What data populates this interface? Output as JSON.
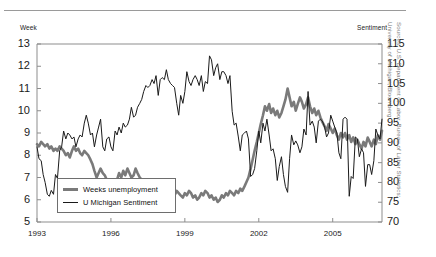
{
  "figure": {
    "left_axis_title": "Week",
    "right_axis_title": "Sentiment",
    "source_line_1": "Sources: U.S. Department of Labor, Bureau of Labor Statistics;",
    "source_line_2": "University of Michigan; Bloomberg",
    "series_color_unemployment": "#7a7a7a",
    "series_color_sentiment": "#1a1a1a",
    "frame_color": "#8d8d8d"
  },
  "legend": {
    "items": [
      {
        "label": "Weeks unemployment",
        "style": "thick-gray"
      },
      {
        "label": "U Michigan Sentiment",
        "style": "thin-black"
      }
    ]
  },
  "chart_data": {
    "type": "line",
    "title": "",
    "subtitle": "",
    "xlabel": "",
    "ylabel": "Week",
    "y2label": "Sentiment",
    "grid": false,
    "legend_position": "inside-bottom-left",
    "xlim": [
      1993.0,
      2007.0
    ],
    "xticks": [
      1993,
      1996,
      1999,
      2002,
      2005
    ],
    "xtick_labels": [
      "1993",
      "1996",
      "1999",
      "2002",
      "2005"
    ],
    "ylim": [
      5,
      13
    ],
    "yticks": [
      5,
      6,
      7,
      8,
      9,
      10,
      11,
      12,
      13
    ],
    "ytick_labels": [
      "5",
      "6",
      "7",
      "8",
      "9",
      "10",
      "11",
      "12",
      "13"
    ],
    "y2lim": [
      70,
      115
    ],
    "y2ticks": [
      70,
      75,
      80,
      85,
      90,
      95,
      100,
      105,
      110,
      115
    ],
    "y2tick_labels": [
      "70",
      "75",
      "80",
      "85",
      "90",
      "95",
      "100",
      "105",
      "110",
      "115"
    ],
    "series": [
      {
        "name": "Weeks unemployment",
        "axis": "left",
        "units": "weeks",
        "color": "#7a7a7a",
        "line_width": 2.6,
        "x": [
          1993.0,
          1993.08,
          1993.17,
          1993.25,
          1993.33,
          1993.42,
          1993.5,
          1993.58,
          1993.67,
          1993.75,
          1993.83,
          1993.92,
          1994.0,
          1994.08,
          1994.17,
          1994.25,
          1994.33,
          1994.42,
          1994.5,
          1994.58,
          1994.67,
          1994.75,
          1994.83,
          1994.92,
          1995.0,
          1995.08,
          1995.17,
          1995.25,
          1995.33,
          1995.42,
          1995.5,
          1995.58,
          1995.67,
          1995.75,
          1995.83,
          1995.92,
          1996.0,
          1996.08,
          1996.17,
          1996.25,
          1996.33,
          1996.42,
          1996.5,
          1996.58,
          1996.67,
          1996.75,
          1996.83,
          1996.92,
          1997.0,
          1997.08,
          1997.17,
          1997.25,
          1997.33,
          1997.42,
          1997.5,
          1997.58,
          1997.67,
          1997.75,
          1997.83,
          1997.92,
          1998.0,
          1998.08,
          1998.17,
          1998.25,
          1998.33,
          1998.42,
          1998.5,
          1998.58,
          1998.67,
          1998.75,
          1998.83,
          1998.92,
          1999.0,
          1999.08,
          1999.17,
          1999.25,
          1999.33,
          1999.42,
          1999.5,
          1999.58,
          1999.67,
          1999.75,
          1999.83,
          1999.92,
          2000.0,
          2000.08,
          2000.17,
          2000.25,
          2000.33,
          2000.42,
          2000.5,
          2000.58,
          2000.67,
          2000.75,
          2000.83,
          2000.92,
          2001.0,
          2001.08,
          2001.17,
          2001.25,
          2001.33,
          2001.42,
          2001.5,
          2001.58,
          2001.67,
          2001.75,
          2001.83,
          2001.92,
          2002.0,
          2002.08,
          2002.17,
          2002.25,
          2002.33,
          2002.42,
          2002.5,
          2002.58,
          2002.67,
          2002.75,
          2002.83,
          2002.92,
          2003.0,
          2003.08,
          2003.17,
          2003.25,
          2003.33,
          2003.42,
          2003.5,
          2003.58,
          2003.67,
          2003.75,
          2003.83,
          2003.92,
          2004.0,
          2004.08,
          2004.17,
          2004.25,
          2004.33,
          2004.42,
          2004.5,
          2004.58,
          2004.67,
          2004.75,
          2004.83,
          2004.92,
          2005.0,
          2005.08,
          2005.17,
          2005.25,
          2005.33,
          2005.42,
          2005.5,
          2005.58,
          2005.67,
          2005.75,
          2005.83,
          2005.92,
          2006.0,
          2006.08,
          2006.17,
          2006.25,
          2006.33,
          2006.42,
          2006.5,
          2006.58,
          2006.67,
          2006.75,
          2006.83,
          2006.92,
          2007.0
        ],
        "y": [
          8.5,
          8.4,
          8.6,
          8.5,
          8.4,
          8.5,
          8.3,
          8.4,
          8.2,
          8.3,
          8.2,
          8.4,
          8.3,
          8.2,
          8.0,
          8.1,
          7.9,
          8.2,
          8.4,
          8.2,
          8.3,
          8.1,
          8.0,
          8.2,
          8.1,
          8.0,
          7.8,
          7.6,
          7.3,
          7.0,
          7.2,
          7.4,
          7.2,
          7.1,
          6.9,
          6.5,
          6.2,
          6.4,
          6.6,
          6.9,
          7.2,
          7.0,
          7.3,
          7.1,
          7.4,
          7.2,
          7.0,
          7.1,
          7.4,
          7.2,
          7.0,
          6.9,
          6.8,
          6.9,
          6.7,
          6.8,
          6.6,
          6.5,
          6.7,
          6.6,
          6.4,
          6.3,
          6.5,
          6.4,
          6.2,
          6.3,
          6.1,
          6.2,
          6.4,
          6.3,
          6.2,
          6.1,
          6.3,
          6.2,
          6.4,
          6.3,
          6.1,
          6.2,
          6.0,
          6.1,
          6.3,
          6.2,
          6.4,
          6.3,
          6.1,
          6.2,
          6.0,
          6.1,
          5.9,
          6.0,
          6.2,
          6.1,
          6.3,
          6.2,
          6.4,
          6.3,
          6.2,
          6.4,
          6.3,
          6.5,
          6.4,
          6.6,
          6.8,
          7.0,
          7.4,
          7.8,
          8.2,
          8.6,
          9.0,
          9.4,
          9.8,
          10.2,
          10.0,
          10.3,
          9.9,
          10.1,
          9.8,
          10.0,
          9.7,
          9.9,
          10.2,
          10.5,
          11.0,
          10.6,
          10.2,
          10.4,
          10.0,
          10.3,
          10.6,
          10.4,
          10.1,
          10.3,
          10.6,
          10.2,
          9.9,
          10.1,
          9.8,
          10.0,
          9.7,
          9.5,
          9.3,
          9.1,
          9.4,
          9.2,
          9.0,
          9.2,
          8.9,
          8.7,
          9.0,
          8.8,
          9.0,
          8.7,
          8.9,
          8.6,
          8.8,
          8.5,
          8.7,
          8.5,
          8.3,
          8.6,
          8.4,
          8.8,
          8.6,
          8.4,
          8.7,
          8.5,
          8.9,
          8.7,
          9.1
        ]
      },
      {
        "name": "U Michigan Sentiment",
        "axis": "right",
        "units": "index",
        "color": "#1a1a1a",
        "line_width": 1.0,
        "x": [
          1993.0,
          1993.08,
          1993.17,
          1993.25,
          1993.33,
          1993.42,
          1993.5,
          1993.58,
          1993.67,
          1993.75,
          1993.83,
          1993.92,
          1994.0,
          1994.08,
          1994.17,
          1994.25,
          1994.33,
          1994.42,
          1994.5,
          1994.58,
          1994.67,
          1994.75,
          1994.83,
          1994.92,
          1995.0,
          1995.08,
          1995.17,
          1995.25,
          1995.33,
          1995.42,
          1995.5,
          1995.58,
          1995.67,
          1995.75,
          1995.83,
          1995.92,
          1996.0,
          1996.08,
          1996.17,
          1996.25,
          1996.33,
          1996.42,
          1996.5,
          1996.58,
          1996.67,
          1996.75,
          1996.83,
          1996.92,
          1997.0,
          1997.08,
          1997.17,
          1997.25,
          1997.33,
          1997.42,
          1997.5,
          1997.58,
          1997.67,
          1997.75,
          1997.83,
          1997.92,
          1998.0,
          1998.08,
          1998.17,
          1998.25,
          1998.33,
          1998.42,
          1998.5,
          1998.58,
          1998.67,
          1998.75,
          1998.83,
          1998.92,
          1999.0,
          1999.08,
          1999.17,
          1999.25,
          1999.33,
          1999.42,
          1999.5,
          1999.58,
          1999.67,
          1999.75,
          1999.83,
          1999.92,
          2000.0,
          2000.08,
          2000.17,
          2000.25,
          2000.33,
          2000.42,
          2000.5,
          2000.58,
          2000.67,
          2000.75,
          2000.83,
          2000.92,
          2001.0,
          2001.08,
          2001.17,
          2001.25,
          2001.33,
          2001.42,
          2001.5,
          2001.58,
          2001.67,
          2001.75,
          2001.83,
          2001.92,
          2002.0,
          2002.08,
          2002.17,
          2002.25,
          2002.33,
          2002.42,
          2002.5,
          2002.58,
          2002.67,
          2002.75,
          2002.83,
          2002.92,
          2003.0,
          2003.08,
          2003.17,
          2003.25,
          2003.33,
          2003.42,
          2003.5,
          2003.58,
          2003.67,
          2003.75,
          2003.83,
          2003.92,
          2004.0,
          2004.08,
          2004.17,
          2004.25,
          2004.33,
          2004.42,
          2004.5,
          2004.58,
          2004.67,
          2004.75,
          2004.83,
          2004.92,
          2005.0,
          2005.08,
          2005.17,
          2005.25,
          2005.33,
          2005.42,
          2005.5,
          2005.58,
          2005.67,
          2005.75,
          2005.83,
          2005.92,
          2006.0,
          2006.08,
          2006.17,
          2006.25,
          2006.33,
          2006.42,
          2006.5,
          2006.58,
          2006.67,
          2006.75,
          2006.83,
          2006.92,
          2007.0
        ],
        "y": [
          89.0,
          86.0,
          85.5,
          82.0,
          80.0,
          77.0,
          76.5,
          78.0,
          77.0,
          82.0,
          81.0,
          88.0,
          89.0,
          93.0,
          91.0,
          92.5,
          92.0,
          91.0,
          91.5,
          89.0,
          91.0,
          92.0,
          91.5,
          95.0,
          97.0,
          95.0,
          92.0,
          92.5,
          89.0,
          92.0,
          94.0,
          96.0,
          89.0,
          88.0,
          91.0,
          91.5,
          89.0,
          88.0,
          93.0,
          92.0,
          94.0,
          92.5,
          95.0,
          94.0,
          94.5,
          96.0,
          99.0,
          96.5,
          97.0,
          99.0,
          100.0,
          101.0,
          103.0,
          104.5,
          104.0,
          104.5,
          106.0,
          105.0,
          107.0,
          102.0,
          106.0,
          106.5,
          106.0,
          108.5,
          106.0,
          105.0,
          104.5,
          104.0,
          100.0,
          97.0,
          102.0,
          100.0,
          103.0,
          108.0,
          105.5,
          104.5,
          106.0,
          107.0,
          106.0,
          104.5,
          107.0,
          103.0,
          105.5,
          105.0,
          112.0,
          111.0,
          107.0,
          109.0,
          110.0,
          106.0,
          108.0,
          108.0,
          107.0,
          105.0,
          107.0,
          98.0,
          94.5,
          95.0,
          91.5,
          88.0,
          92.0,
          92.5,
          93.0,
          91.0,
          81.5,
          82.0,
          83.5,
          88.0,
          93.0,
          90.0,
          95.0,
          93.0,
          96.0,
          92.0,
          88.0,
          88.5,
          86.0,
          80.5,
          84.0,
          86.5,
          82.0,
          79.0,
          77.5,
          86.0,
          92.0,
          89.5,
          90.5,
          89.5,
          87.5,
          89.0,
          93.5,
          92.0,
          103.0,
          94.5,
          95.5,
          94.0,
          90.0,
          95.5,
          96.0,
          95.5,
          94.0,
          91.5,
          92.5,
          97.0,
          95.5,
          94.0,
          92.5,
          87.5,
          86.0,
          96.0,
          96.5,
          96.0,
          76.5,
          81.5,
          81.0,
          91.5,
          91.0,
          86.5,
          88.5,
          87.5,
          79.0,
          84.5,
          84.5,
          82.0,
          85.5,
          93.5,
          92.0,
          91.0,
          96.0
        ]
      }
    ]
  }
}
